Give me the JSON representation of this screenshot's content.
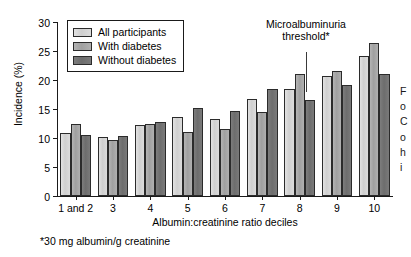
{
  "chart_data": {
    "type": "bar",
    "title": "",
    "xlabel": "Albumin:creatinine ratio deciles",
    "ylabel": "Incidence (%)",
    "categories": [
      "1 and 2",
      "3",
      "4",
      "5",
      "6",
      "7",
      "8",
      "9",
      "10"
    ],
    "ylim": [
      0,
      30
    ],
    "yticks": [
      0,
      5,
      10,
      15,
      20,
      25,
      30
    ],
    "grid": false,
    "legend_position": "top-left",
    "series": [
      {
        "name": "All participants",
        "color": "#d5d5d5",
        "values": [
          10.9,
          10.2,
          12.3,
          13.6,
          13.2,
          16.8,
          18.4,
          20.7,
          24.2
        ]
      },
      {
        "name": "With diabetes",
        "color": "#a8a8a8",
        "values": [
          12.4,
          9.7,
          12.5,
          11.1,
          11.6,
          14.4,
          21.0,
          21.6,
          26.4
        ]
      },
      {
        "name": "Without diabetes",
        "color": "#737373",
        "values": [
          10.5,
          10.4,
          12.8,
          15.1,
          14.6,
          18.4,
          16.6,
          19.2,
          21.0
        ]
      }
    ],
    "annotations": [
      {
        "text": "Microalbuminuria threshold*",
        "line1": "Microalbuminuria",
        "line2": "threshold*",
        "points_to_category": "8",
        "points_to_series": "With diabetes"
      }
    ],
    "footnote": "*30 mg albumin/g creatinine"
  },
  "legend": {
    "items": [
      {
        "label": "All participants"
      },
      {
        "label": "With diabetes"
      },
      {
        "label": "Without diabetes"
      }
    ]
  },
  "side_caption": {
    "lines": [
      "F",
      "o",
      "C",
      "o",
      "h",
      "i"
    ]
  }
}
